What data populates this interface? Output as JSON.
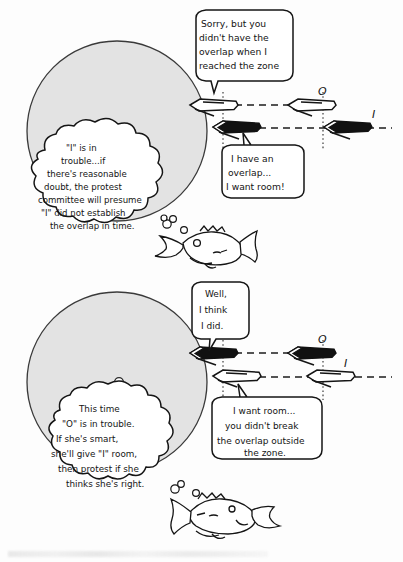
{
  "colors": {
    "ink": "#141414",
    "zone_fill": "#e3e3e3",
    "zone_stroke": "#3a3a3a",
    "boat_filled": "#111111",
    "boat_outline": "#ffffff",
    "paper": "#fdfdfd"
  },
  "panels": [
    {
      "id": "panel-top",
      "zone": {
        "label_mark": "mark"
      },
      "boats": [
        {
          "name": "O",
          "style": "outline",
          "lane": "upper",
          "position": "at-zone"
        },
        {
          "name": "O",
          "style": "outline",
          "lane": "upper",
          "position": "approaching"
        },
        {
          "name": "I",
          "style": "filled",
          "lane": "lower",
          "position": "at-zone"
        },
        {
          "name": "I",
          "style": "filled",
          "lane": "lower",
          "position": "approaching"
        }
      ],
      "labels": {
        "outside_boat": "O",
        "inside_boat": "I"
      },
      "speech_bubbles": [
        {
          "id": "speech-o-top",
          "speaker": "O",
          "lines": [
            "Sorry, but you",
            "didn't have the",
            "overlap when I",
            "reached the zone"
          ]
        },
        {
          "id": "speech-i-top",
          "speaker": "I",
          "lines": [
            "I have an",
            "overlap...",
            "I want room!"
          ]
        }
      ],
      "thought_cloud": {
        "id": "thought-top",
        "lines": [
          "\"I\" is in",
          "trouble...if",
          "there's reasonable",
          "doubt, the protest",
          "committee will presume",
          "\"I\" did not establish",
          "the overlap in time."
        ]
      },
      "fish": {
        "name": "fish-left",
        "facing": "left",
        "bubbles": 3
      }
    },
    {
      "id": "panel-bottom",
      "zone": {
        "label_mark": "mark"
      },
      "boats": [
        {
          "name": "O",
          "style": "filled",
          "lane": "upper",
          "position": "at-zone"
        },
        {
          "name": "O",
          "style": "filled",
          "lane": "upper",
          "position": "approaching"
        },
        {
          "name": "I",
          "style": "outline",
          "lane": "lower",
          "position": "at-zone"
        },
        {
          "name": "I",
          "style": "outline",
          "lane": "lower",
          "position": "approaching"
        }
      ],
      "labels": {
        "outside_boat": "O",
        "inside_boat": "I"
      },
      "speech_bubbles": [
        {
          "id": "speech-o-bottom",
          "speaker": "O",
          "lines": [
            "Well,",
            "I think",
            "I did."
          ]
        },
        {
          "id": "speech-i-bottom",
          "speaker": "I",
          "lines": [
            "I want room...",
            "you didn't break",
            "the overlap outside",
            "the zone."
          ]
        }
      ],
      "thought_cloud": {
        "id": "thought-bottom",
        "lines": [
          "This time",
          "\"O\" is in trouble.",
          "If she's smart,",
          "she'll give \"I\" room,",
          "then protest if she",
          "thinks she's right."
        ]
      },
      "fish": {
        "name": "fish-right",
        "facing": "right",
        "bubbles": 2
      }
    }
  ]
}
